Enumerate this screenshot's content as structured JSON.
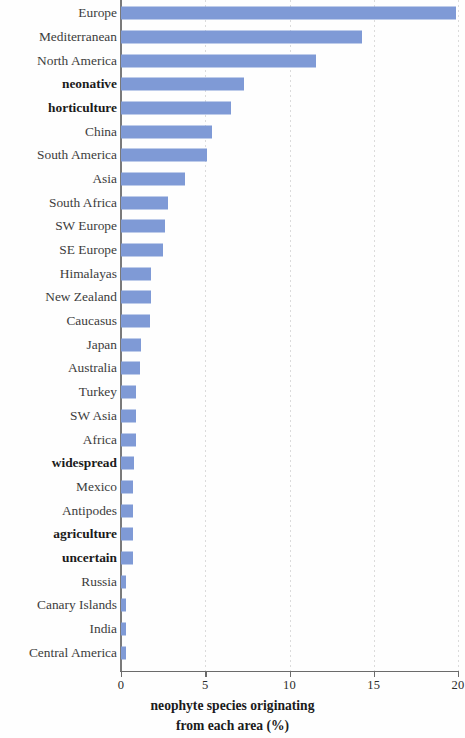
{
  "chart_data": {
    "type": "bar",
    "orientation": "horizontal",
    "title": "",
    "subtitle": "",
    "xlabel": "neophyte species originating from each area (%)",
    "xlabel_line1": "neophyte species originating",
    "xlabel_line2": "from each area (%)",
    "ylabel": "",
    "xlim": [
      0,
      20
    ],
    "xticks": [
      0,
      5,
      10,
      15,
      20
    ],
    "xticklabels": [
      "0",
      "5",
      "10",
      "15",
      "20"
    ],
    "grid": "vertical-dotted",
    "legend": "none",
    "bar_color": "#7f9ad6",
    "categories": [
      "Europe",
      "Mediterranean",
      "North America",
      "neonative",
      "horticulture",
      "China",
      "South America",
      "Asia",
      "South Africa",
      "SW Europe",
      "SE Europe",
      "Himalayas",
      "New Zealand",
      "Caucasus",
      "Japan",
      "Australia",
      "Turkey",
      "SW Asia",
      "Africa",
      "widespread",
      "Mexico",
      "Antipodes",
      "agriculture",
      "uncertain",
      "Russia",
      "Canary Islands",
      "India",
      "Central America"
    ],
    "values": [
      19.9,
      14.3,
      11.6,
      7.3,
      6.5,
      5.4,
      5.1,
      3.8,
      2.8,
      2.6,
      2.5,
      1.8,
      1.8,
      1.7,
      1.2,
      1.1,
      0.9,
      0.9,
      0.9,
      0.8,
      0.7,
      0.7,
      0.7,
      0.7,
      0.3,
      0.3,
      0.3,
      0.3
    ],
    "bold_categories": [
      "neonative",
      "horticulture",
      "widespread",
      "agriculture",
      "uncertain"
    ]
  }
}
